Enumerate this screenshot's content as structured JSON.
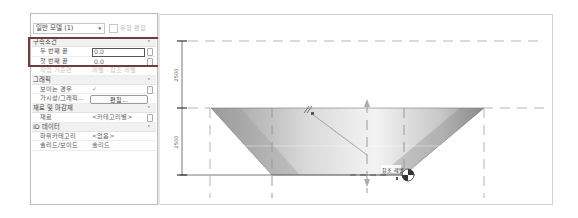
{
  "properties_panel": {
    "type_selector": {
      "value": "일반 모델 (1)",
      "arrow": "▾"
    },
    "edit_type_label": "유형 편집",
    "groups": [
      {
        "name": "구속조건",
        "rows": [
          {
            "label": "두 번째 끝",
            "value": "0.0"
          },
          {
            "label": "첫 번째 끝",
            "value": "0.0"
          },
          {
            "label": "작업 기준면",
            "value": "레벨 : 참조 레벨"
          }
        ]
      },
      {
        "name": "그래픽",
        "rows": [
          {
            "label": "보이는 경우",
            "value": "✓"
          },
          {
            "label": "가시성/그래픽...",
            "value": "편집..."
          }
        ]
      },
      {
        "name": "재료 및 마감재",
        "rows": [
          {
            "label": "재료",
            "value": "<카테고리별>"
          }
        ]
      },
      {
        "name": "ID 데이터",
        "rows": [
          {
            "label": "하위카테고리",
            "value": "<없음>"
          },
          {
            "label": "솔리드/보이드",
            "value": "솔리드"
          }
        ]
      }
    ],
    "collapse_glyph": "⌃"
  },
  "drawing": {
    "dimensions": [
      {
        "value": "2500",
        "position": "upper"
      },
      {
        "value": "2500",
        "position": "lower"
      }
    ],
    "reference_label": "참조 레벨",
    "colors": {
      "highlight_border": "#6e3c3a",
      "shape_fill_dark": "#8a8a8a",
      "shape_fill_light": "#f2f2f2",
      "dash_line": "#b5b5b5",
      "dimension_line": "#555555"
    }
  }
}
